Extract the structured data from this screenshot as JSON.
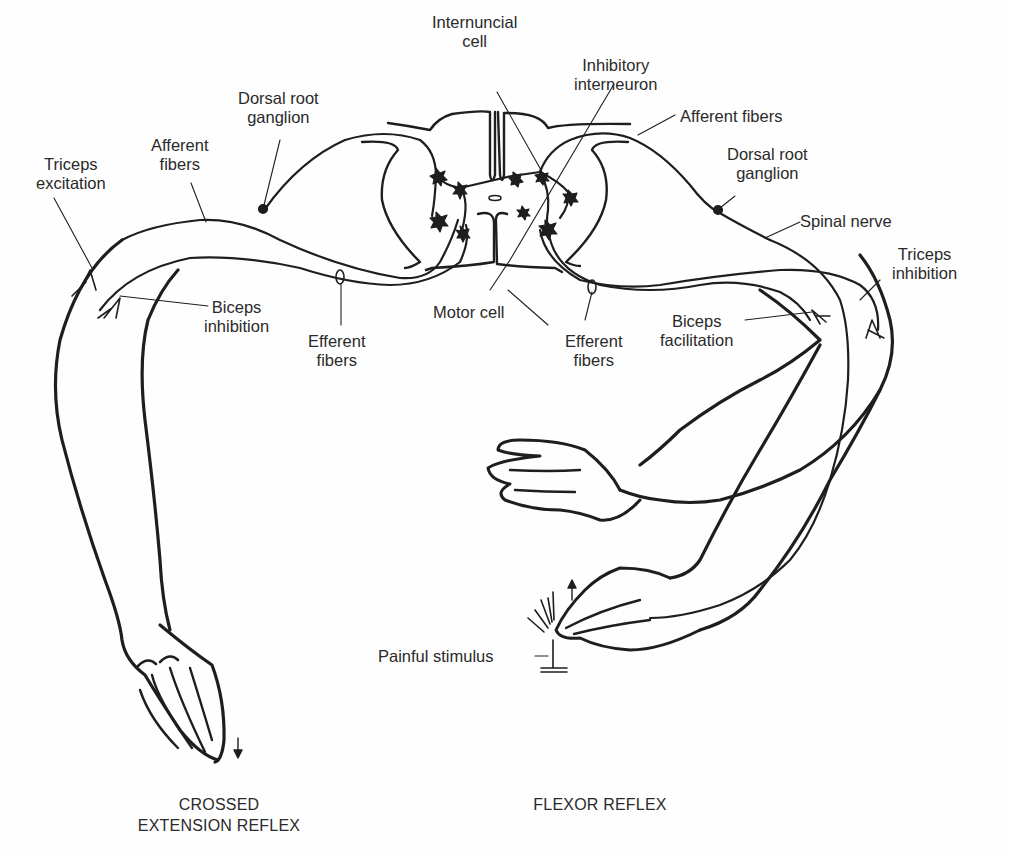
{
  "diagram": {
    "labels": {
      "internuncial_cell": [
        "Internuncial",
        "cell"
      ],
      "inhibitory_interneuron": [
        "Inhibitory",
        "interneuron"
      ],
      "dorsal_root_ganglion_left": [
        "Dorsal root",
        "ganglion"
      ],
      "afferent_fibers_left": [
        "Afferent",
        "fibers"
      ],
      "triceps_excitation": [
        "Triceps",
        "excitation"
      ],
      "afferent_fibers_right": "Afferent fibers",
      "dorsal_root_ganglion_right": [
        "Dorsal root",
        "ganglion"
      ],
      "spinal_nerve": "Spinal nerve",
      "triceps_inhibition": [
        "Triceps",
        "inhibition"
      ],
      "biceps_inhibition": [
        "Biceps",
        "inhibition"
      ],
      "efferent_fibers_left": [
        "Efferent",
        "fibers"
      ],
      "motor_cell": "Motor cell",
      "efferent_fibers_right": [
        "Efferent",
        "fibers"
      ],
      "biceps_facilitation": [
        "Biceps",
        "facilitation"
      ],
      "painful_stimulus": "Painful stimulus"
    },
    "captions": {
      "left": [
        "CROSSED",
        "EXTENSION REFLEX"
      ],
      "right": "FLEXOR REFLEX"
    },
    "colors": {
      "line": "#1e1e1e",
      "background": "#fefefe"
    }
  }
}
